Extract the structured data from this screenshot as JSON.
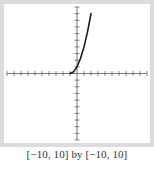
{
  "chart_data": {
    "type": "line",
    "title": "",
    "xlabel": "",
    "ylabel": "",
    "xlim": [
      -10,
      10
    ],
    "ylim": [
      -10,
      10
    ],
    "x_tick_step": 1,
    "y_tick_step": 1,
    "grid": false,
    "legend": null,
    "series": [
      {
        "name": "curve",
        "x": [
          -1,
          -0.5,
          0,
          0.5,
          1,
          1.5,
          2
        ],
        "y": [
          0,
          0.25,
          1,
          2.25,
          4,
          6.25,
          9
        ]
      }
    ],
    "annotations": []
  },
  "caption": "[−10, 10] by [−10, 10]",
  "colors": {
    "frame": "#dcdcdc",
    "axis": "#555555",
    "curve": "#1a1a1a",
    "caption": "#333333"
  }
}
